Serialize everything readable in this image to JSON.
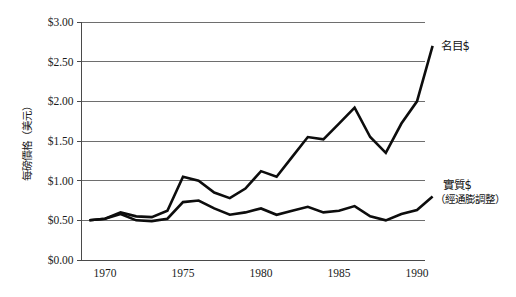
{
  "chart_data": {
    "type": "line",
    "title": "",
    "xlabel": "",
    "ylabel": "每磅價格（美元）",
    "xlim": [
      1969,
      1991
    ],
    "ylim": [
      0.0,
      3.0
    ],
    "grid": true,
    "legend_position": "right-inline",
    "y_ticks": [
      "$0.00",
      "$0.50",
      "$1.00",
      "$1.50",
      "$2.00",
      "$2.50",
      "$3.00"
    ],
    "y_tick_values": [
      0.0,
      0.5,
      1.0,
      1.5,
      2.0,
      2.5,
      3.0
    ],
    "x_ticks": [
      "1970",
      "1975",
      "1980",
      "1985",
      "1990"
    ],
    "x_tick_values": [
      1970,
      1975,
      1980,
      1985,
      1990
    ],
    "x": [
      1969,
      1970,
      1971,
      1972,
      1973,
      1974,
      1975,
      1976,
      1977,
      1978,
      1979,
      1980,
      1981,
      1982,
      1983,
      1984,
      1985,
      1986,
      1987,
      1988,
      1989,
      1990,
      1991
    ],
    "series": [
      {
        "name": "名目$",
        "label": "名目$",
        "sublabel": "",
        "color": "#0d0d0d",
        "values": [
          0.5,
          0.52,
          0.6,
          0.55,
          0.54,
          0.62,
          1.05,
          1.0,
          0.85,
          0.78,
          0.9,
          1.12,
          1.05,
          1.3,
          1.55,
          1.52,
          1.72,
          1.92,
          1.55,
          1.35,
          1.72,
          2.0,
          2.7
        ]
      },
      {
        "name": "實質$",
        "label": "實質$",
        "sublabel": "（經通膨調整）",
        "color": "#0d0d0d",
        "values": [
          0.5,
          0.52,
          0.58,
          0.5,
          0.49,
          0.52,
          0.73,
          0.75,
          0.65,
          0.57,
          0.6,
          0.65,
          0.57,
          0.62,
          0.67,
          0.6,
          0.62,
          0.68,
          0.55,
          0.5,
          0.58,
          0.63,
          0.8
        ]
      }
    ]
  }
}
